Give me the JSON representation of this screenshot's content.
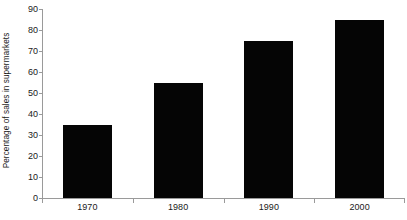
{
  "chart_data": {
    "type": "bar",
    "title": "",
    "xlabel": "",
    "ylabel": "Percentage of sales in supermarkets",
    "categories": [
      "1970",
      "1980",
      "1990",
      "2000"
    ],
    "values": [
      35,
      55,
      75,
      85
    ],
    "ylim": [
      0,
      90
    ],
    "yticks": [
      "0",
      "10",
      "20",
      "30",
      "40",
      "50",
      "60",
      "70",
      "80",
      "90"
    ],
    "ytick_values": [
      0,
      10,
      20,
      30,
      40,
      50,
      60,
      70,
      80,
      90
    ],
    "grid": false,
    "legend": null,
    "series": [
      {
        "name": "Percentage of sales in supermarkets",
        "values": [
          35,
          55,
          75,
          85
        ],
        "color": "#050505"
      }
    ],
    "colors": {
      "bar": "#050505",
      "axis": "#9a9a9a",
      "text": "#1a1a1a",
      "background": "#ffffff"
    }
  }
}
